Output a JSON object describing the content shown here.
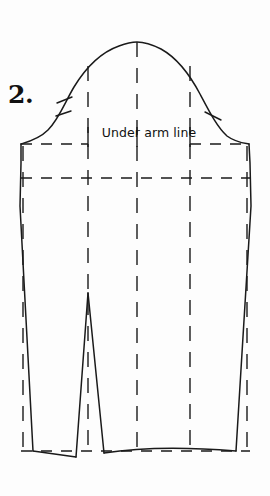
{
  "page": {
    "background_color": "#fdfdfd",
    "ink_color": "#1a1a1a",
    "width": 270,
    "height": 496
  },
  "step": {
    "number_label": "2."
  },
  "labels": {
    "underarm_line": "Under arm line"
  },
  "diagram": {
    "kind": "sewing-pattern-sleeve-block",
    "outline": {
      "cap_apex": {
        "x": 137,
        "y": 42
      },
      "left_underarm_corner": {
        "x": 21,
        "y": 144
      },
      "right_underarm_corner": {
        "x": 249,
        "y": 144
      },
      "left_hem_corner": {
        "x": 33,
        "y": 451
      },
      "right_hem_corner": {
        "x": 236,
        "y": 451
      },
      "hem_y": 451
    },
    "solid_paths": [
      {
        "name": "sleeve-cap-curve",
        "d": "M 21 144 C 27 142 38 139 47 130 C 58 119 64 103 73 88 C 84 70 98 54 118 46 C 126 43 132 42 137 42 C 144 42 152 44 160 48 C 178 58 190 76 199 93 C 208 110 216 126 226 135 C 234 142 243 143 249 144"
      },
      {
        "name": "left-side-seam",
        "d": "M 21 144 L 21 160 L 20 205 L 33 451"
      },
      {
        "name": "right-side-seam",
        "d": "M 249 144 L 250 160 L 251 205 L 236 451"
      },
      {
        "name": "hem-left-segment",
        "d": "M 33 451 L 74 456 L 76 456"
      },
      {
        "name": "hem-curve-right",
        "d": "M 104 453 C 140 448 185 447 236 451"
      },
      {
        "name": "dart-left-leg",
        "d": "M 76 456 L 88 293"
      },
      {
        "name": "dart-right-leg",
        "d": "M 88 293 L 104 453"
      }
    ],
    "dashed_paths": [
      {
        "name": "under-arm-line",
        "orientation": "horizontal",
        "y": 144,
        "x1": 21,
        "x2": 249,
        "note": "Broken line running through the label text"
      },
      {
        "name": "bicep-guide-line",
        "orientation": "horizontal",
        "y": 178,
        "x1": 21,
        "x2": 250
      },
      {
        "name": "hem-guide-line",
        "orientation": "horizontal",
        "y": 451,
        "x1": 21,
        "x2": 250
      },
      {
        "name": "slash-line-1",
        "orientation": "vertical",
        "x": 23,
        "y1": 144,
        "y2": 451
      },
      {
        "name": "slash-line-2",
        "orientation": "vertical",
        "x": 88,
        "y1": 66,
        "y2": 451
      },
      {
        "name": "slash-line-3",
        "orientation": "vertical",
        "x": 137,
        "y1": 42,
        "y2": 451
      },
      {
        "name": "slash-line-4",
        "orientation": "vertical",
        "x": 190,
        "y1": 66,
        "y2": 451
      },
      {
        "name": "slash-line-5",
        "orientation": "vertical",
        "x": 247,
        "y1": 144,
        "y2": 451
      }
    ],
    "notch_marks": [
      {
        "name": "front-notch-upper",
        "d": "M 58 104 L 72 98"
      },
      {
        "name": "front-notch-lower",
        "d": "M 56 116 L 71 111"
      },
      {
        "name": "back-notch",
        "d": "M 205 113 L 220 120"
      }
    ],
    "label_ticks": [
      {
        "name": "label-tick-left",
        "x": 88,
        "y1": 126,
        "y2": 146
      },
      {
        "name": "label-tick-mid",
        "x": 137,
        "y1": 126,
        "y2": 146
      },
      {
        "name": "label-tick-right",
        "x": 190,
        "y1": 126,
        "y2": 146
      }
    ]
  }
}
